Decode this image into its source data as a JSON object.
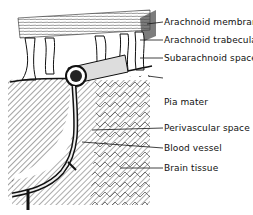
{
  "figure": {
    "labels": [
      {
        "id": "arachnoid-membrane",
        "text": "Arachnoid membrane"
      },
      {
        "id": "arachnoid-trabecula",
        "text": "Arachnoid trabecula"
      },
      {
        "id": "subarachnoid-space",
        "text": "Subarachnoid space"
      },
      {
        "id": "pia-mater",
        "text": "Pia mater"
      },
      {
        "id": "perivascular-space",
        "text": "Perivascular space"
      },
      {
        "id": "blood-vessel",
        "text": "Blood vessel"
      },
      {
        "id": "brain-tissue",
        "text": "Brain tissue"
      }
    ]
  }
}
